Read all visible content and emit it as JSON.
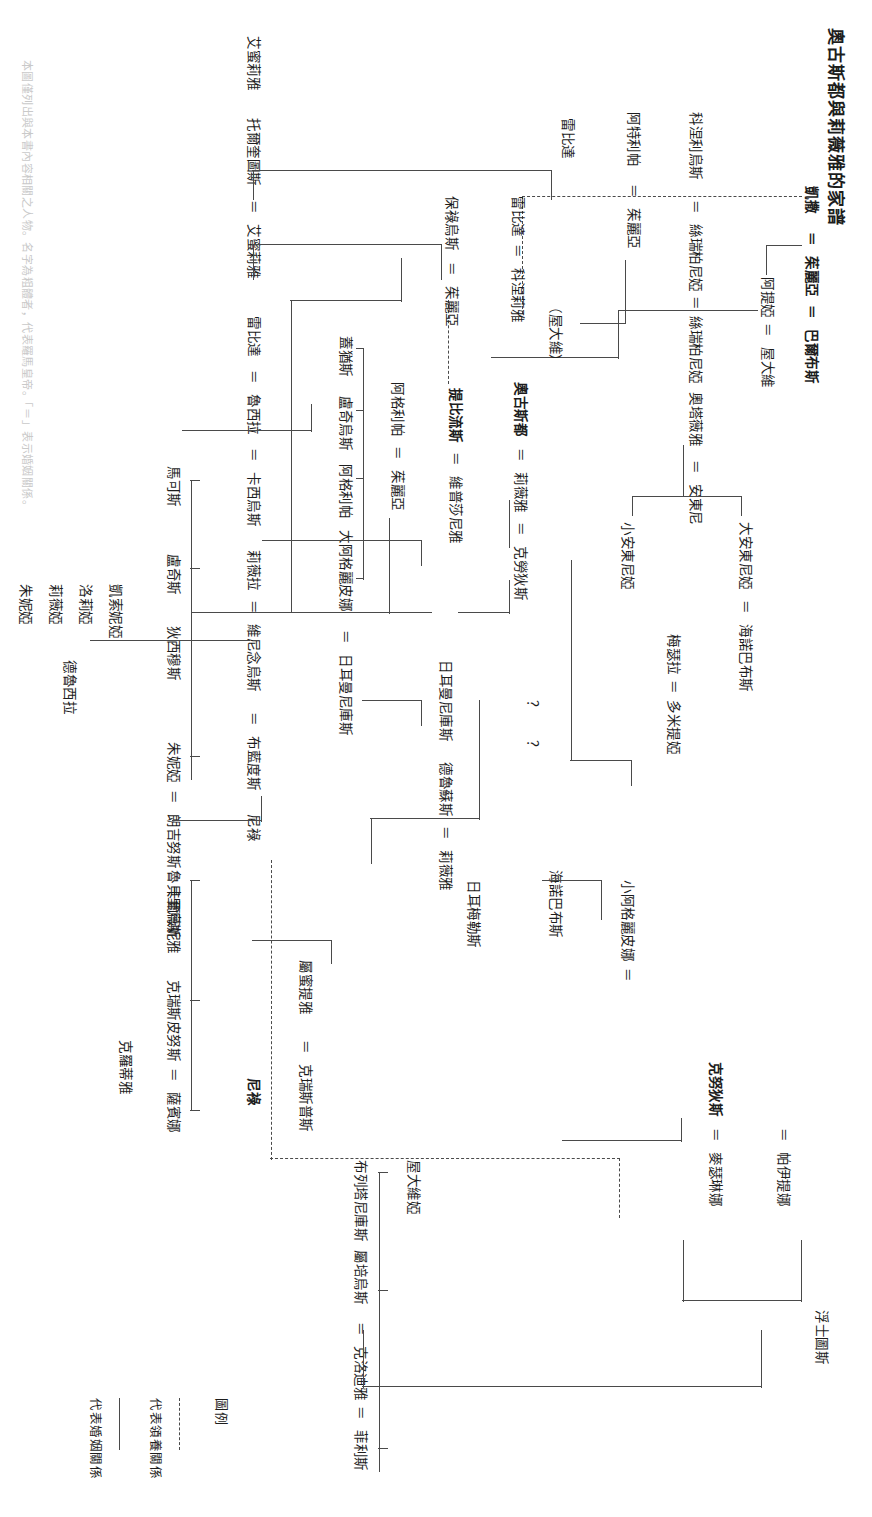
{
  "document": {
    "title": "奧古斯都與莉薇雅的家譜",
    "orientation": "landscape-rotated-90",
    "caption": "本圖僅列出與本書內容相關之人物。名字為粗體者，代表羅馬皇帝。「＝」表示婚姻關係。"
  },
  "legend": {
    "heading": "圖例",
    "adoption_label": "代表領養關係",
    "marriage_label": "代表婚姻關係"
  },
  "generations": {
    "g0": {
      "caesar": "凱撒",
      "julia": "茱麗亞",
      "balbus": "巴爾布斯"
    },
    "g1": {
      "atia": "阿提婭",
      "octavius": "屋大維",
      "cornelius": "科涅利烏斯",
      "scribonia": "絲瑞柏尼婭",
      "atilius": "阿特利帕",
      "julia_b": "茱麗亞",
      "lepidus_top": "雷比達",
      "claudius_head": "克勞狄斯"
    },
    "g2": {
      "octavia": "奧塔薇雅",
      "antony": "安東尼",
      "augustus": "奧古斯都",
      "livia": "莉薇雅",
      "claudius": "克勞狄斯",
      "drusus": "德魯蘇斯",
      "tiberius": "提比流斯",
      "vipsania": "維普莎尼雅",
      "agrippa": "阿格利帕",
      "julia_c": "茱麗亞",
      "octavius_paren": "（屋大維）",
      "lepida": "雷比達",
      "cornelia": "科涅莉雅",
      "paulus": "保祿烏斯",
      "julia_d": "茱麗亞"
    },
    "g3": {
      "antonia_minor": "小安東尼婭",
      "antonia_major": "大安東尼婭",
      "ahenobarbus": "海諾巴布斯",
      "domitius": "德魯蘇斯",
      "livilla": "莉薇雅",
      "messalla": "梅瑟拉",
      "domitia": "多米提婭",
      "germanicus_drusus": "日耳曼尼庫斯",
      "drusus2": "德魯蘇斯",
      "livia_b": "莉薇雅",
      "question1": "？",
      "question2": "？",
      "gaius": "蓋猶斯",
      "lucius": "盧奇烏斯",
      "agrippa_p": "阿格利帕",
      "agrippina_major": "大阿格麗皮娜",
      "germanicus": "日耳曼尼庫斯",
      "germellus": "日耳梅勒斯",
      "aemilia": "艾蜜莉雅",
      "torquatus": "托爾奎圖斯",
      "aemilia_b": "艾蜜莉雅",
      "lepida_b": "雷比達",
      "drusilla": "魯西拉",
      "cassius": "卡西烏斯"
    },
    "g4": {
      "nero": "尼祿",
      "agrippina_minor": "小阿格麗皮娜",
      "ahenobarbus2": "海諾巴布斯",
      "caligula": "克努狄斯",
      "caesonia": "麥瑟琳娜",
      "drusilla2": "帕伊提娜",
      "floating": "浮士圖斯",
      "brandus": "布藍度斯",
      "nero2": "尼祿",
      "livilla2": "莉薇拉",
      "vinicius": "維尼念烏斯",
      "junia": "屬蜜提雅",
      "crispus": "克瑞斯普斯",
      "rubellius": "魯貝里烏斯",
      "crispinus": "克瑞斯皮努斯",
      "sabina": "薩賓娜",
      "claudia_label": "克羅蒂雅",
      "junius": "朗吉努斯",
      "calvisia": "卡爾薇妮雅",
      "junia_b": "朱妮婭",
      "decimus": "狄西穆斯",
      "lucius_b": "盧奇斯",
      "marcus": "馬可斯",
      "germanicus_b": "布列塔尼庫斯",
      "rubellius_b": "屬培烏斯",
      "claudia_c": "克洛迪雅",
      "felix": "菲利斯",
      "octavia_b": "屋大維婭",
      "drususilla": "德魯西拉",
      "junilla": "朱妮婭",
      "livilla3": "莉薇婭",
      "claudilla": "洛莉婭",
      "caesonia2": "凱索妮婭",
      "claudius_jr": "克勞狄斯",
      "claudius_k": "克努牧斯"
    }
  },
  "nodes": [
    {
      "id": "n_caesar",
      "label": "凱撒",
      "x": 155,
      "y": 32,
      "bold": true
    },
    {
      "id": "n_eq1",
      "label": "＝",
      "x": 202,
      "y": 32,
      "bold": true
    },
    {
      "id": "n_julia1",
      "label": "茱麗亞",
      "x": 229,
      "y": 32,
      "bold": true
    },
    {
      "id": "n_eq2",
      "label": "＝",
      "x": 278,
      "y": 32,
      "bold": true
    },
    {
      "id": "n_balbus",
      "label": "巴爾布斯",
      "x": 304,
      "y": 32,
      "bold": true
    },
    {
      "id": "n_atia",
      "label": "阿提婭",
      "x": 210,
      "y": 95
    },
    {
      "id": "n_eq3",
      "label": "＝",
      "x": 255,
      "y": 95
    },
    {
      "id": "n_octavius",
      "label": "屋大維",
      "x": 280,
      "y": 95
    },
    {
      "id": "n_cornelius",
      "label": "科涅利烏斯",
      "x": 120,
      "y": 152
    },
    {
      "id": "n_eq4",
      "label": "＝",
      "x": 200,
      "y": 152
    },
    {
      "id": "n_scribonia",
      "label": "絲瑞柏尼婭",
      "x": 225,
      "y": 152
    },
    {
      "id": "n_eq5",
      "label": "＝",
      "x": 303,
      "y": 152
    },
    {
      "id": "n_scribonia2",
      "label": "絲瑞柏尼婭",
      "x": 326,
      "y": 152
    },
    {
      "id": "n_atilius",
      "label": "阿特利帕",
      "x": 120,
      "y": 212
    },
    {
      "id": "n_eq6",
      "label": "＝",
      "x": 183,
      "y": 212
    },
    {
      "id": "n_julia2",
      "label": "茱麗亞",
      "x": 208,
      "y": 212
    },
    {
      "id": "n_octavia",
      "label": "奧塔薇雅",
      "x": 280,
      "y": 270
    },
    {
      "id": "n_eq7",
      "label": "＝",
      "x": 345,
      "y": 270
    },
    {
      "id": "n_antony",
      "label": "安東尼",
      "x": 370,
      "y": 270
    },
    {
      "id": "n_paren_oct",
      "label": "（屋大維）",
      "x": 202,
      "y": 330
    },
    {
      "id": "n_augustus",
      "label": "奧古斯都",
      "x": 276,
      "y": 330,
      "bold": true
    },
    {
      "id": "n_eq8",
      "label": "＝",
      "x": 338,
      "y": 330
    },
    {
      "id": "n_livia",
      "label": "莉薇雅",
      "x": 362,
      "y": 330
    },
    {
      "id": "n_eq9",
      "label": "＝",
      "x": 408,
      "y": 330
    },
    {
      "id": "n_claudius",
      "label": "克勞狄斯",
      "x": 432,
      "y": 330
    },
    {
      "id": "n_tiberius",
      "label": "提比流斯",
      "x": 262,
      "y": 388,
      "bold": true
    },
    {
      "id": "n_eq10",
      "label": "＝",
      "x": 325,
      "y": 388
    },
    {
      "id": "n_vipsania",
      "label": "維普莎尼雅",
      "x": 350,
      "y": 388
    },
    {
      "id": "n_agrippa",
      "label": "阿格利帕",
      "x": 255,
      "y": 446
    },
    {
      "id": "n_eq11",
      "label": "＝",
      "x": 318,
      "y": 446
    },
    {
      "id": "n_julia3",
      "label": "茱麗亞",
      "x": 342,
      "y": 446
    },
    {
      "id": "n_lepidus",
      "label": "雷比達",
      "x": 70,
      "y": 505
    },
    {
      "id": "n_eq12",
      "label": "＝",
      "x": 117,
      "y": 505
    },
    {
      "id": "n_cornelia",
      "label": "科涅莉雅",
      "x": 141,
      "y": 505
    },
    {
      "id": "n_paulus",
      "label": "保祿烏斯",
      "x": 226,
      "y": 564
    },
    {
      "id": "n_eq13",
      "label": "＝",
      "x": 290,
      "y": 564
    },
    {
      "id": "n_julia4",
      "label": "茱麗亞",
      "x": 314,
      "y": 564
    },
    {
      "id": "n_antonia_min",
      "label": "小安東尼婭",
      "x": 435,
      "y": 215
    },
    {
      "id": "n_antonia_maj",
      "label": "大安東尼婭",
      "x": 512,
      "y": 215
    },
    {
      "id": "n_messalla",
      "label": "梅瑟拉",
      "x": 430,
      "y": 155
    },
    {
      "id": "n_eqm",
      "label": "＝",
      "x": 473,
      "y": 155
    },
    {
      "id": "n_domitia",
      "label": "多米提婭",
      "x": 493,
      "y": 155
    },
    {
      "id": "n_germ_drusus",
      "label": "日耳曼尼庫斯",
      "x": 400,
      "y": 392
    },
    {
      "id": "n_drusus",
      "label": "德魯蘇斯",
      "x": 492,
      "y": 392
    },
    {
      "id": "n_eqd",
      "label": "＝",
      "x": 556,
      "y": 392
    },
    {
      "id": "n_livia_b",
      "label": "莉薇雅",
      "x": 580,
      "y": 392
    },
    {
      "id": "n_q1",
      "label": "？",
      "x": 500,
      "y": 330
    },
    {
      "id": "n_q2",
      "label": "？",
      "x": 540,
      "y": 330
    },
    {
      "id": "n_gaius",
      "label": "蓋猶斯",
      "x": 452,
      "y": 505
    },
    {
      "id": "n_lucius",
      "label": "盧奇烏斯",
      "x": 510,
      "y": 505
    },
    {
      "id": "n_agrippa_p",
      "label": "阿格利帕",
      "x": 576,
      "y": 505
    },
    {
      "id": "n_agrippina_maj",
      "label": "大阿格麗皮娜",
      "x": 640,
      "y": 505
    },
    {
      "id": "n_germanicus",
      "label": "日耳曼尼庫斯",
      "x": 745,
      "y": 505
    },
    {
      "id": "n_germellus",
      "label": "日耳梅勒斯",
      "x": 660,
      "y": 455
    }
  ],
  "icons": {
    "adoption_line": "dashed-line-icon",
    "marriage_line": "equals-icon"
  }
}
